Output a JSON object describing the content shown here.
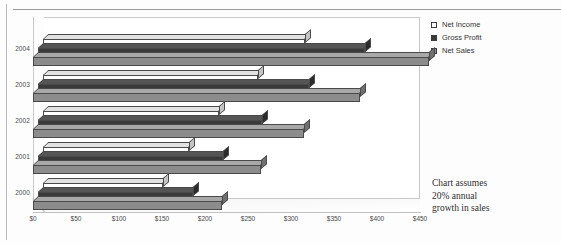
{
  "chart_data": {
    "type": "bar",
    "orientation": "horizontal",
    "style": "3d-clustered-bar",
    "title": "",
    "xlabel": "",
    "ylabel": "",
    "categories": [
      "2004",
      "2003",
      "2002",
      "2001",
      "2000"
    ],
    "series": [
      {
        "name": "Net Income",
        "color": "#ffffff",
        "values": [
          305,
          250,
          205,
          170,
          140
        ]
      },
      {
        "name": "Gross Profit",
        "color": "#3a3a3a",
        "values": [
          380,
          315,
          260,
          215,
          180
        ]
      },
      {
        "name": "Net Sales",
        "color": "#8c8c8c",
        "values": [
          460,
          380,
          315,
          265,
          220
        ]
      }
    ],
    "xlim": [
      0,
      450
    ],
    "xticks": [
      0,
      50,
      100,
      150,
      200,
      250,
      300,
      350,
      400,
      450
    ],
    "xtick_labels": [
      "$0",
      "$50",
      "$100",
      "$150",
      "$200",
      "$250",
      "$300",
      "$350",
      "$400",
      "$450"
    ],
    "grid": false,
    "legend_position": "right",
    "annotation": "Chart assumes 20% annual growth in sales"
  },
  "legend": {
    "items": [
      {
        "label": "Net Income",
        "swatch": "sw-netincome",
        "icon": "legend-swatch-icon"
      },
      {
        "label": "Gross Profit",
        "swatch": "sw-grossprofit",
        "icon": "legend-swatch-icon"
      },
      {
        "label": "Net Sales",
        "swatch": "sw-netsales",
        "icon": "legend-swatch-icon"
      }
    ]
  },
  "annotation": {
    "line1": "Chart assumes",
    "line2": "20% annual",
    "line3": "growth in sales"
  },
  "axis": {
    "years": [
      "2004",
      "2003",
      "2002",
      "2001",
      "2000"
    ],
    "xtick_labels": [
      "$0",
      "$50",
      "$100",
      "$150",
      "$200",
      "$250",
      "$300",
      "$350",
      "$400",
      "$450"
    ]
  }
}
